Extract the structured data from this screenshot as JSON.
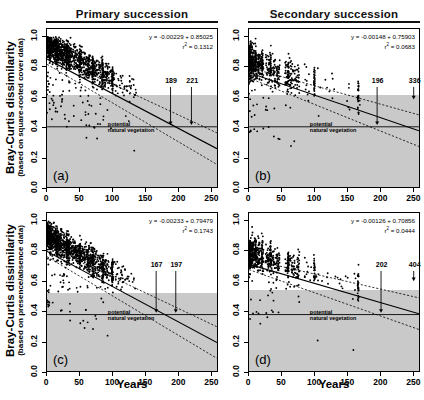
{
  "figure": {
    "width": 424,
    "height": 400,
    "column_titles": [
      "Primary succession",
      "Secondary succession"
    ],
    "row_ylabels": [
      {
        "main": "Bray-Curtis dissimilarity",
        "sub": "(based on square-rooted cover data)"
      },
      {
        "main": "Bray-Curtis dissimilarity",
        "sub": "(based on presence/absence data)"
      }
    ],
    "xlabel": "Years",
    "xticks": [
      0,
      50,
      100,
      150,
      200,
      250
    ],
    "yticks": [
      "0.0",
      "0.2",
      "0.4",
      "0.6",
      "0.8",
      "1.0"
    ],
    "xlim": [
      0,
      260
    ],
    "ylim": [
      0,
      1.05
    ],
    "band_color": "#c9c9c9",
    "point_color": "#000000",
    "line_color": "#000000"
  },
  "chart_data": [
    {
      "type": "scatter",
      "panel": "(a)",
      "title": "Primary succession",
      "xlabel": "Years",
      "ylabel": "Bray-Curtis dissimilarity (based on square-rooted cover data)",
      "xlim": [
        0,
        260
      ],
      "ylim": [
        0,
        1.05
      ],
      "xticks": [
        0,
        50,
        100,
        150,
        200,
        250
      ],
      "yticks": [
        0.0,
        0.2,
        0.4,
        0.6,
        0.8,
        1.0
      ],
      "grid": false,
      "equation": "y = -0.00229 + 0.85025",
      "r2_label": "r  = 0.1312",
      "slope": -0.00229,
      "intercept": 0.85025,
      "r2": 0.1312,
      "pnv_line_y": 0.4,
      "band_top": 0.615,
      "band_bottom": 0.4,
      "annotations": [
        {
          "label": "189",
          "x": 189,
          "y": 0.415
        },
        {
          "label": "221",
          "x": 221,
          "y": 0.415
        }
      ],
      "pnv_text": "potential\nnatural vegetation",
      "n_points": 1100,
      "seed": 11
    },
    {
      "type": "scatter",
      "panel": "(b)",
      "title": "Secondary succession",
      "xlabel": "Years",
      "ylabel": "Bray-Curtis dissimilarity (based on square-rooted cover data)",
      "xlim": [
        0,
        260
      ],
      "ylim": [
        0,
        1.05
      ],
      "xticks": [
        0,
        50,
        100,
        150,
        200,
        250
      ],
      "yticks": [
        0.0,
        0.2,
        0.4,
        0.6,
        0.8,
        1.0
      ],
      "grid": false,
      "equation": "y = -0.00148 + 0.75903",
      "r2_label": "r  = 0.0683",
      "slope": -0.00148,
      "intercept": 0.75903,
      "r2": 0.0683,
      "pnv_line_y": 0.4,
      "band_top": 0.615,
      "band_bottom": 0.4,
      "annotations": [
        {
          "label": "196",
          "x": 196,
          "y": 0.415
        },
        {
          "label": "336",
          "x": 252,
          "y": 0.585
        }
      ],
      "pnv_text": "potential\nnatural vegetation",
      "n_points": 520,
      "seed": 23
    },
    {
      "type": "scatter",
      "panel": "(c)",
      "title": "Primary succession",
      "xlabel": "Years",
      "ylabel": "Bray-Curtis dissimilarity (based on presence/absence data)",
      "xlim": [
        0,
        260
      ],
      "ylim": [
        0,
        1.05
      ],
      "xticks": [
        0,
        50,
        100,
        150,
        200,
        250
      ],
      "yticks": [
        0.0,
        0.2,
        0.4,
        0.6,
        0.8,
        1.0
      ],
      "grid": false,
      "equation": "y = -0.00233 + 0.79479",
      "r2_label": "r  = 0.1743",
      "slope": -0.00233,
      "intercept": 0.79479,
      "r2": 0.1743,
      "pnv_line_y": 0.375,
      "band_top": 0.525,
      "band_bottom": 0.375,
      "annotations": [
        {
          "label": "167",
          "x": 167,
          "y": 0.39
        },
        {
          "label": "197",
          "x": 197,
          "y": 0.39
        }
      ],
      "pnv_text": "potential\nnatural vegetation",
      "n_points": 1100,
      "seed": 37
    },
    {
      "type": "scatter",
      "panel": "(d)",
      "title": "Secondary succession",
      "xlabel": "Years",
      "ylabel": "Bray-Curtis dissimilarity (based on presence/absence data)",
      "xlim": [
        0,
        260
      ],
      "ylim": [
        0,
        1.05
      ],
      "xticks": [
        0,
        50,
        100,
        150,
        200,
        250
      ],
      "yticks": [
        0.0,
        0.2,
        0.4,
        0.6,
        0.8,
        1.0
      ],
      "grid": false,
      "equation": "y = -0.00126 + 0.70856",
      "r2_label": "r  = 0.0444",
      "slope": -0.00126,
      "intercept": 0.70856,
      "r2": 0.0444,
      "pnv_line_y": 0.375,
      "band_top": 0.545,
      "band_bottom": 0.375,
      "annotations": [
        {
          "label": "202",
          "x": 202,
          "y": 0.39
        },
        {
          "label": "404",
          "x": 252,
          "y": 0.6
        }
      ],
      "pnv_text": "potential\nnatural vegetation",
      "n_points": 520,
      "seed": 53
    }
  ]
}
